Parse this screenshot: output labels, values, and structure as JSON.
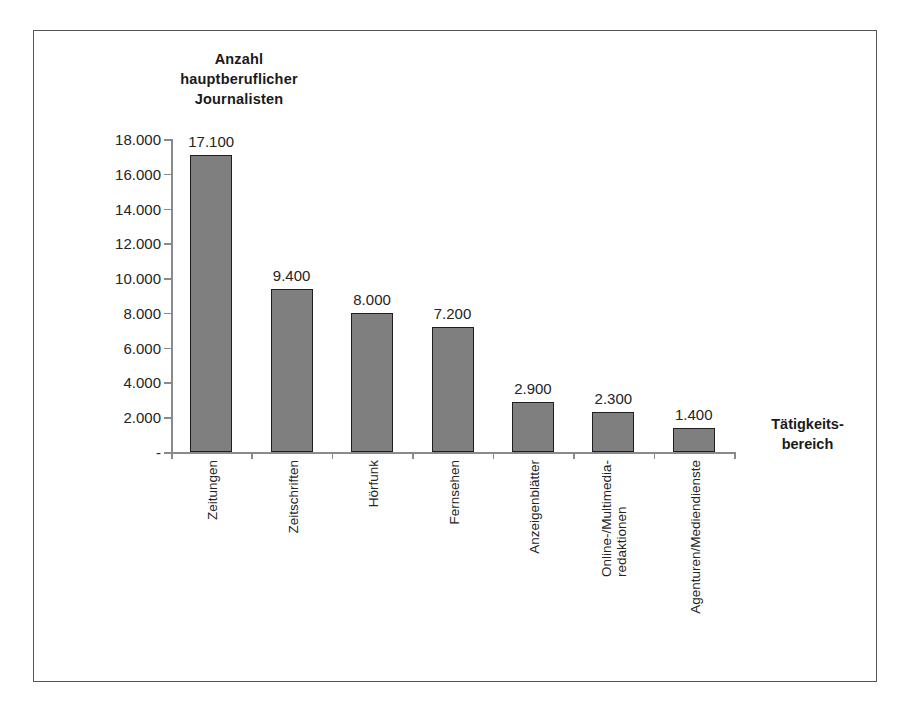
{
  "chart_data": {
    "type": "bar",
    "title": "Anzahl hauptberuflicher Journalisten",
    "ylabel": "Anzahl\nhauptberuflicher\nJournalisten",
    "xlabel": "Tätigkeits-\nbereich",
    "categories": [
      "Zeitungen",
      "Zeitschriften",
      "Hörfunk",
      "Fernsehen",
      "Anzeigenblätter",
      "Online-/Multimedia-\nredaktionen",
      "Agenturen/Mediendienste"
    ],
    "values": [
      17100,
      9400,
      8000,
      7200,
      2900,
      2300,
      1400
    ],
    "value_labels": [
      "17.100",
      "9.400",
      "8.000",
      "7.200",
      "2.900",
      "2.300",
      "1.400"
    ],
    "ylim": [
      0,
      18000
    ],
    "ytick_values": [
      18000,
      16000,
      14000,
      12000,
      10000,
      8000,
      6000,
      4000,
      2000,
      0
    ],
    "ytick_labels": [
      "18.000",
      "16.000",
      "14.000",
      "12.000",
      "10.000",
      "8.000",
      "6.000",
      "4.000",
      "2.000",
      "-"
    ],
    "grid": false,
    "legend": false,
    "bar_color": "#7f7f7f",
    "bar_border_color": "#1f1f1f",
    "axis_color": "#8a8a8a",
    "text_color": "#242424",
    "frame_color": "#555555",
    "background": "#ffffff"
  }
}
